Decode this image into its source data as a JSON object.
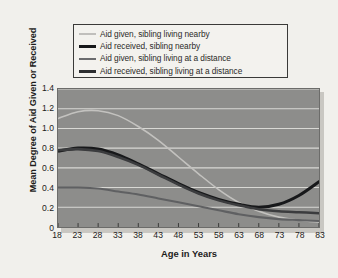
{
  "chart_data": {
    "type": "line",
    "title": "",
    "xlabel": "Age in Years",
    "ylabel": "Mean Degree of Aid Given or Received",
    "xlim": [
      18,
      83
    ],
    "ylim": [
      0,
      1.4
    ],
    "grid": true,
    "legend_position": "above-plot",
    "xticks": [
      "18",
      "23",
      "28",
      "33",
      "38",
      "43",
      "48",
      "53",
      "58",
      "63",
      "68",
      "73",
      "78",
      "83"
    ],
    "yticks": [
      "0",
      "0.2",
      "0.4",
      "0.6",
      "0.8",
      "1.0",
      "1.2",
      "1.4"
    ],
    "x": [
      18,
      23,
      28,
      33,
      38,
      43,
      48,
      53,
      58,
      63,
      68,
      73,
      78,
      83
    ],
    "series": [
      {
        "name": "Aid given, sibling living nearby",
        "color": "#c3c2bf",
        "width": 1.6,
        "values": [
          1.1,
          1.17,
          1.18,
          1.13,
          1.02,
          0.88,
          0.71,
          0.54,
          0.38,
          0.25,
          0.16,
          0.1,
          0.07,
          0.05
        ]
      },
      {
        "name": "Aid received, sibling nearby",
        "color": "#17181a",
        "width": 3.1,
        "values": [
          0.77,
          0.8,
          0.79,
          0.73,
          0.64,
          0.54,
          0.44,
          0.35,
          0.28,
          0.23,
          0.2,
          0.23,
          0.32,
          0.46
        ]
      },
      {
        "name": "Aid given, sibling living at a distance",
        "color": "#5f6062",
        "width": 2.1,
        "values": [
          0.4,
          0.4,
          0.39,
          0.36,
          0.33,
          0.29,
          0.25,
          0.21,
          0.17,
          0.13,
          0.1,
          0.08,
          0.07,
          0.06
        ]
      },
      {
        "name": "Aid received, sibling living at a distance",
        "color": "#3b3c3e",
        "width": 2.6,
        "values": [
          0.78,
          0.79,
          0.77,
          0.71,
          0.63,
          0.53,
          0.43,
          0.34,
          0.27,
          0.22,
          0.18,
          0.16,
          0.15,
          0.14
        ]
      }
    ]
  },
  "legend": {
    "items": [
      {
        "label": "Aid given, sibling living nearby",
        "color": "#c0bfbc",
        "thickness": "2.2px"
      },
      {
        "label": "Aid received, sibling nearby",
        "color": "#17181a",
        "thickness": "3.4px"
      },
      {
        "label": "Aid given, sibling living at a distance",
        "color": "#6b6c6e",
        "thickness": "2.6px"
      },
      {
        "label": "Aid received, sibling living at a distance",
        "color": "#2d2e30",
        "thickness": "3.1px"
      }
    ]
  },
  "colors": {
    "page_background": "#efeeea",
    "plot_background": "#8d8d8b",
    "gridline": "#d8d8d4",
    "legend_border": "#3a3a38",
    "text": "#1d1c1b"
  }
}
